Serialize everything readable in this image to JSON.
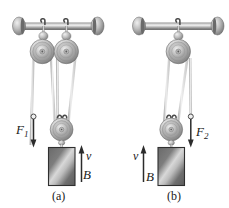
{
  "figure": {
    "background_color": "#ffffff",
    "ink_color": "#1a1a1a",
    "metal_light": "#e8e8e8",
    "metal_mid": "#9a9a9a",
    "metal_dark": "#5a5a5a",
    "rope_color": "#d9d9d9",
    "block_color": "#6e6e6e"
  },
  "panels": [
    {
      "id": "a",
      "caption": "(a)",
      "force_label": "F",
      "force_subscript": "1",
      "force_direction": "down",
      "velocity_label": "v",
      "velocity_direction": "up",
      "block_label": "B",
      "fixed_pulley_count": "2",
      "movable_pulley_count": "1"
    },
    {
      "id": "b",
      "caption": "(b)",
      "force_label": "F",
      "force_subscript": "2",
      "force_direction": "down",
      "velocity_label": "v",
      "velocity_direction": "up",
      "block_label": "B",
      "fixed_pulley_count": "1",
      "movable_pulley_count": "1"
    }
  ],
  "parts": {
    "support_bar": "horizontal-support-bar",
    "end_cap_left": "bar-end-cap",
    "end_cap_right": "bar-end-cap",
    "hook": "pulley-hook",
    "rope": "rope",
    "block": "block-b"
  }
}
